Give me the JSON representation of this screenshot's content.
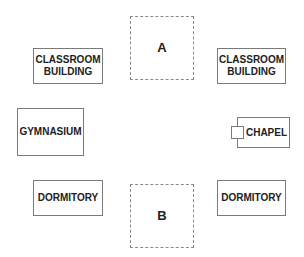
{
  "diagram": {
    "plots": [
      {
        "id": "A",
        "label": "A"
      },
      {
        "id": "B",
        "label": "B"
      }
    ],
    "buildings": {
      "classroom_left": "CLASSROOM\nBUILDING",
      "classroom_right": "CLASSROOM\nBUILDING",
      "gymnasium": "GYMNASIUM",
      "chapel": "CHAPEL",
      "dormitory_left": "DORMITORY",
      "dormitory_right": "DORMITORY"
    }
  }
}
